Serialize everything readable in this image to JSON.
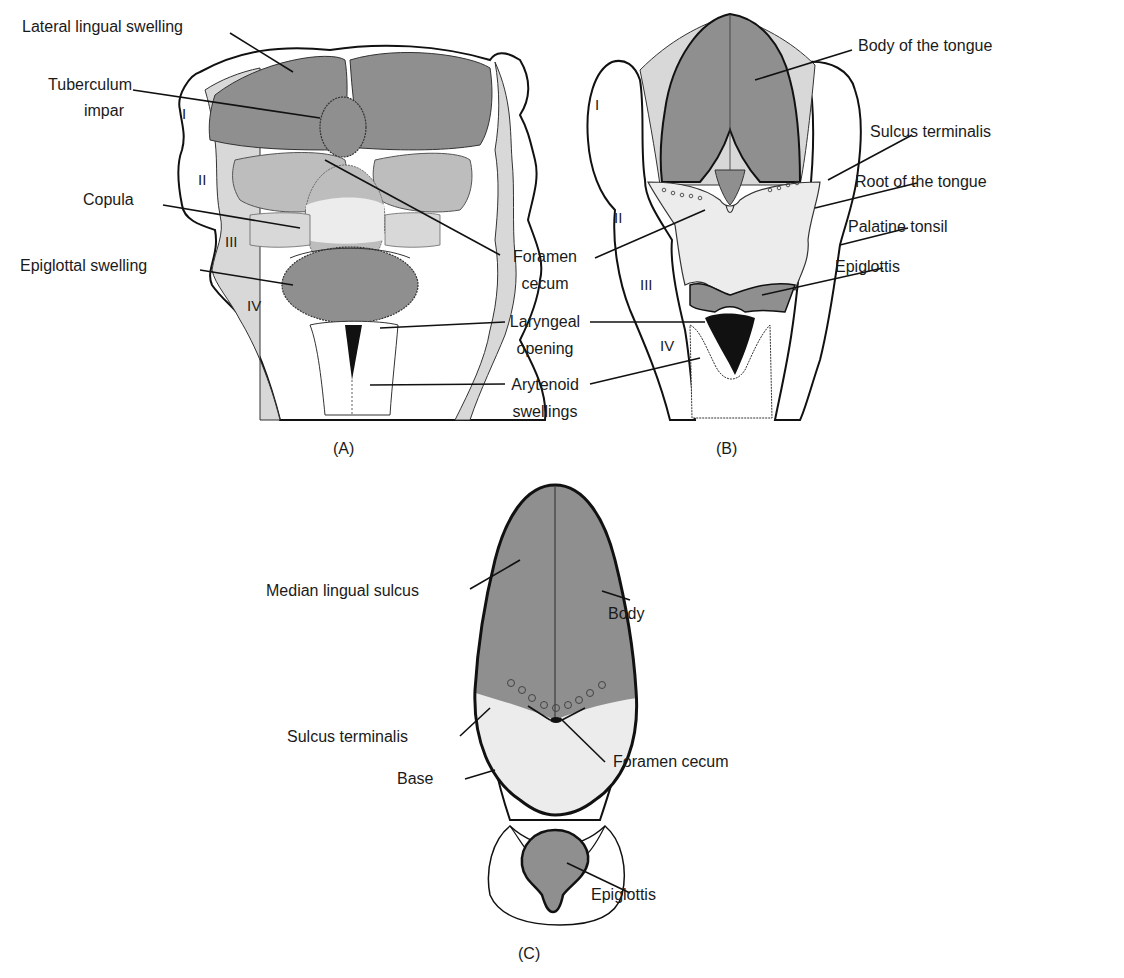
{
  "colors": {
    "dark_gray": "#8f8f8f",
    "mid_gray": "#bdbdbd",
    "light_gray": "#ececec",
    "outline": "#111111"
  },
  "panel_a": {
    "caption": "(A)",
    "arch_numerals": [
      "I",
      "II",
      "III",
      "IV"
    ],
    "labels": {
      "lateral_lingual_swelling": "Lateral lingual swelling",
      "tuberculum_impar_1": "Tuberculum",
      "tuberculum_impar_2": "impar",
      "copula": "Copula",
      "epiglottal_swelling": "Epiglottal swelling"
    }
  },
  "shared_labels": {
    "foramen_cecum_1": "Foramen",
    "foramen_cecum_2": "cecum",
    "laryngeal_opening_1": "Laryngeal",
    "laryngeal_opening_2": "opening",
    "arytenoid_swellings_1": "Arytenoid",
    "arytenoid_swellings_2": "swellings"
  },
  "panel_b": {
    "caption": "(B)",
    "arch_numerals": [
      "I",
      "II",
      "III",
      "IV"
    ],
    "labels": {
      "body_of_tongue": "Body of the tongue",
      "sulcus_terminalis": "Sulcus terminalis",
      "root_of_tongue": "Root of the tongue",
      "palatine_tonsil": "Palatine tonsil",
      "epiglottis": "Epiglottis"
    }
  },
  "panel_c": {
    "caption": "(C)",
    "labels": {
      "median_lingual_sulcus": "Median lingual sulcus",
      "body": "Body",
      "sulcus_terminalis": "Sulcus terminalis",
      "foramen_cecum": "Foramen cecum",
      "base": "Base",
      "epiglottis": "Epiglottis"
    }
  }
}
